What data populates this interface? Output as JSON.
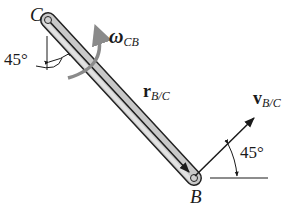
{
  "diagram": {
    "type": "rigid-body kinematics",
    "points": {
      "C": {
        "label": "C"
      },
      "B": {
        "label": "B"
      }
    },
    "angular_velocity": {
      "symbol": "ω",
      "subscript": "CB"
    },
    "position_vector": {
      "symbol": "r",
      "subscript": "B/C"
    },
    "velocity_vector": {
      "symbol": "v",
      "subscript": "B/C"
    },
    "angle_at_C": "45°",
    "angle_at_B": "45°"
  },
  "colors": {
    "bar_fill": "#c8c8c8",
    "bar_outline": "#222222",
    "arrow_gray": "#8a8a8a",
    "line": "#1a1a1a"
  }
}
